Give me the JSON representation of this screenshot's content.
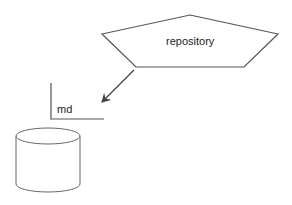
{
  "diagram": {
    "nodes": [
      {
        "id": "repository",
        "shape": "pentagon",
        "label": "repository"
      },
      {
        "id": "md",
        "shape": "note-bracket",
        "label": "md"
      },
      {
        "id": "db",
        "shape": "cylinder",
        "label": ""
      }
    ],
    "edges": [
      {
        "from": "repository",
        "to": "md",
        "type": "arrow"
      }
    ],
    "colors": {
      "stroke": "#555555",
      "fill": "#ffffff",
      "text": "#222222"
    }
  }
}
